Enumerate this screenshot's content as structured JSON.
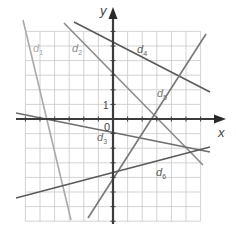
{
  "diagram": {
    "type": "coordinate-plane-lines",
    "axes": {
      "x_label": "x",
      "y_label": "y",
      "origin_label": "0",
      "unit_label": "1",
      "origin_px": [
        113,
        119
      ],
      "unit_px": 14.6,
      "x_range": [
        -6,
        6
      ],
      "y_range": [
        -7,
        6
      ]
    },
    "colors": {
      "grid": "#c8c8c8",
      "axis": "#3c3c3c",
      "text": "#444444"
    },
    "lines": [
      {
        "name": "d1",
        "label": "d",
        "sub": "1",
        "color": "#aaaaaa",
        "p1": [
          23,
          20
        ],
        "p2": [
          71,
          220
        ],
        "label_pos": [
          33,
          52
        ]
      },
      {
        "name": "d2",
        "label": "d",
        "sub": "2",
        "color": "#8a8a8a",
        "p1": [
          64,
          23
        ],
        "p2": [
          203,
          165
        ],
        "label_pos": [
          72,
          52
        ]
      },
      {
        "name": "d3",
        "label": "d",
        "sub": "3",
        "color": "#6e6e6e",
        "p1": [
          16,
          113
        ],
        "p2": [
          210,
          152
        ],
        "label_pos": [
          97,
          141
        ]
      },
      {
        "name": "d4",
        "label": "d",
        "sub": "4",
        "color": "#5a5a5a",
        "p1": [
          74,
          22
        ],
        "p2": [
          210,
          92
        ],
        "label_pos": [
          137,
          53
        ]
      },
      {
        "name": "d5",
        "label": "d",
        "sub": "5",
        "color": "#777777",
        "p1": [
          88,
          218
        ],
        "p2": [
          206,
          34
        ],
        "label_pos": [
          157,
          97
        ]
      },
      {
        "name": "d6",
        "label": "d",
        "sub": "6",
        "color": "#5a5a5a",
        "p1": [
          16,
          198
        ],
        "p2": [
          210,
          147
        ],
        "label_pos": [
          156,
          176
        ]
      }
    ]
  }
}
